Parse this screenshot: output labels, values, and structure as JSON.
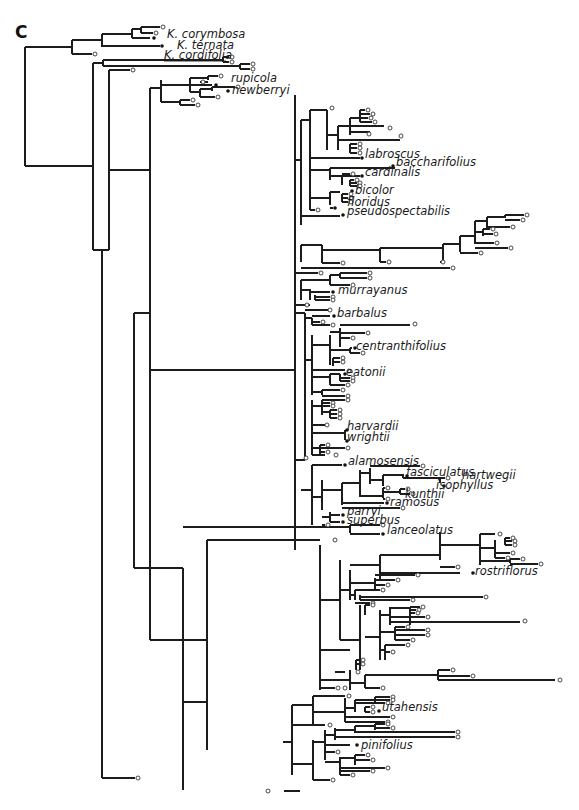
{
  "figure": {
    "panel_label": "C",
    "type": "phylogenetic-tree",
    "tip_symbols": {
      "open_circle": "sampled tip (unlabeled)",
      "filled_dot": "labeled species"
    },
    "labels": [
      {
        "id": "corymbosa",
        "text": "K. corymbosa",
        "x": 167,
        "y": 38
      },
      {
        "id": "ternata",
        "text": "K. ternata",
        "x": 177,
        "y": 49
      },
      {
        "id": "cordifolia",
        "text": "K. cordifolia",
        "x": 164,
        "y": 59,
        "underline": true
      },
      {
        "id": "rupicola",
        "text": "rupicola",
        "x": 231,
        "y": 82
      },
      {
        "id": "newberryi",
        "text": "newberryi",
        "x": 232,
        "y": 94
      },
      {
        "id": "labroscus",
        "text": "labroscus",
        "x": 365,
        "y": 158
      },
      {
        "id": "baccharifolius",
        "text": "baccharifolius",
        "x": 396,
        "y": 166
      },
      {
        "id": "cardinalis",
        "text": "cardinalis",
        "x": 365,
        "y": 176
      },
      {
        "id": "bicolor",
        "text": "bicolor",
        "x": 355,
        "y": 194
      },
      {
        "id": "floridus",
        "text": "floridus",
        "x": 347,
        "y": 206
      },
      {
        "id": "pseudospectabilis",
        "text": "pseudospectabilis",
        "x": 347,
        "y": 215
      },
      {
        "id": "murrayanus",
        "text": "murrayanus",
        "x": 338,
        "y": 294
      },
      {
        "id": "barbalus",
        "text": "barbalus",
        "x": 337,
        "y": 317
      },
      {
        "id": "centranthifolius",
        "text": "centranthifolius",
        "x": 356,
        "y": 350
      },
      {
        "id": "eatonii",
        "text": "eatonii",
        "x": 346,
        "y": 376
      },
      {
        "id": "harvardii",
        "text": "harvardii",
        "x": 347,
        "y": 430
      },
      {
        "id": "wrightii",
        "text": "wrightii",
        "x": 347,
        "y": 441
      },
      {
        "id": "alamosensis",
        "text": "alamosensis",
        "x": 348,
        "y": 465
      },
      {
        "id": "fasciculatus",
        "text": "fasciculatus",
        "x": 406,
        "y": 476
      },
      {
        "id": "hartwegii",
        "text": "hartwegii",
        "x": 462,
        "y": 479
      },
      {
        "id": "isophyllus",
        "text": "isophyllus",
        "x": 436,
        "y": 489
      },
      {
        "id": "kunthii",
        "text": "kunthii",
        "x": 405,
        "y": 498
      },
      {
        "id": "ramosus",
        "text": "ramosus",
        "x": 390,
        "y": 506
      },
      {
        "id": "parryi",
        "text": "parryi",
        "x": 347,
        "y": 515
      },
      {
        "id": "superbus",
        "text": "superbus",
        "x": 347,
        "y": 524
      },
      {
        "id": "lanceolatus",
        "text": "lanceolatus",
        "x": 387,
        "y": 534
      },
      {
        "id": "rostriflorus",
        "text": "rostriflorus",
        "x": 475,
        "y": 575
      },
      {
        "id": "utahensis",
        "text": "utahensis",
        "x": 382,
        "y": 711
      },
      {
        "id": "pinifolius",
        "text": "pinifolius",
        "x": 361,
        "y": 749
      }
    ]
  },
  "tree": {
    "color": "#1c1c1c",
    "segments": [
      [
        25,
        47,
        25,
        166
      ],
      [
        25,
        47,
        72,
        47
      ],
      [
        25,
        166,
        93,
        166
      ],
      [
        72,
        40,
        72,
        54
      ],
      [
        72,
        40,
        102,
        40
      ],
      [
        72,
        54,
        95,
        54
      ],
      [
        102,
        34,
        102,
        46
      ],
      [
        102,
        34,
        132,
        34
      ],
      [
        102,
        46,
        160,
        46
      ],
      [
        132,
        29,
        132,
        38
      ],
      [
        132,
        29,
        141,
        29
      ],
      [
        141,
        28,
        141,
        33
      ],
      [
        141,
        28,
        163,
        28
      ],
      [
        141,
        33,
        160,
        33
      ],
      [
        132,
        38,
        153,
        38
      ],
      [
        93,
        63,
        93,
        249
      ],
      [
        93,
        63,
        103,
        63
      ],
      [
        103,
        63,
        103,
        60
      ],
      [
        103,
        60,
        143,
        60
      ],
      [
        103,
        65,
        143,
        65
      ],
      [
        143,
        60,
        143,
        67
      ],
      [
        143,
        60,
        225,
        60
      ],
      [
        225,
        57,
        225,
        63
      ],
      [
        225,
        57,
        240,
        57
      ],
      [
        225,
        63,
        240,
        63
      ],
      [
        143,
        67,
        250,
        67
      ],
      [
        250,
        64,
        250,
        70
      ],
      [
        250,
        64,
        257,
        64
      ],
      [
        250,
        70,
        257,
        70
      ],
      [
        93,
        249,
        104,
        249
      ],
      [
        104,
        249,
        104,
        250
      ],
      [
        100,
        70,
        100,
        500
      ],
      [
        100,
        70,
        110,
        70
      ],
      [
        104,
        250,
        104,
        270
      ]
    ],
    "open_tips": [],
    "filled_tips": []
  }
}
